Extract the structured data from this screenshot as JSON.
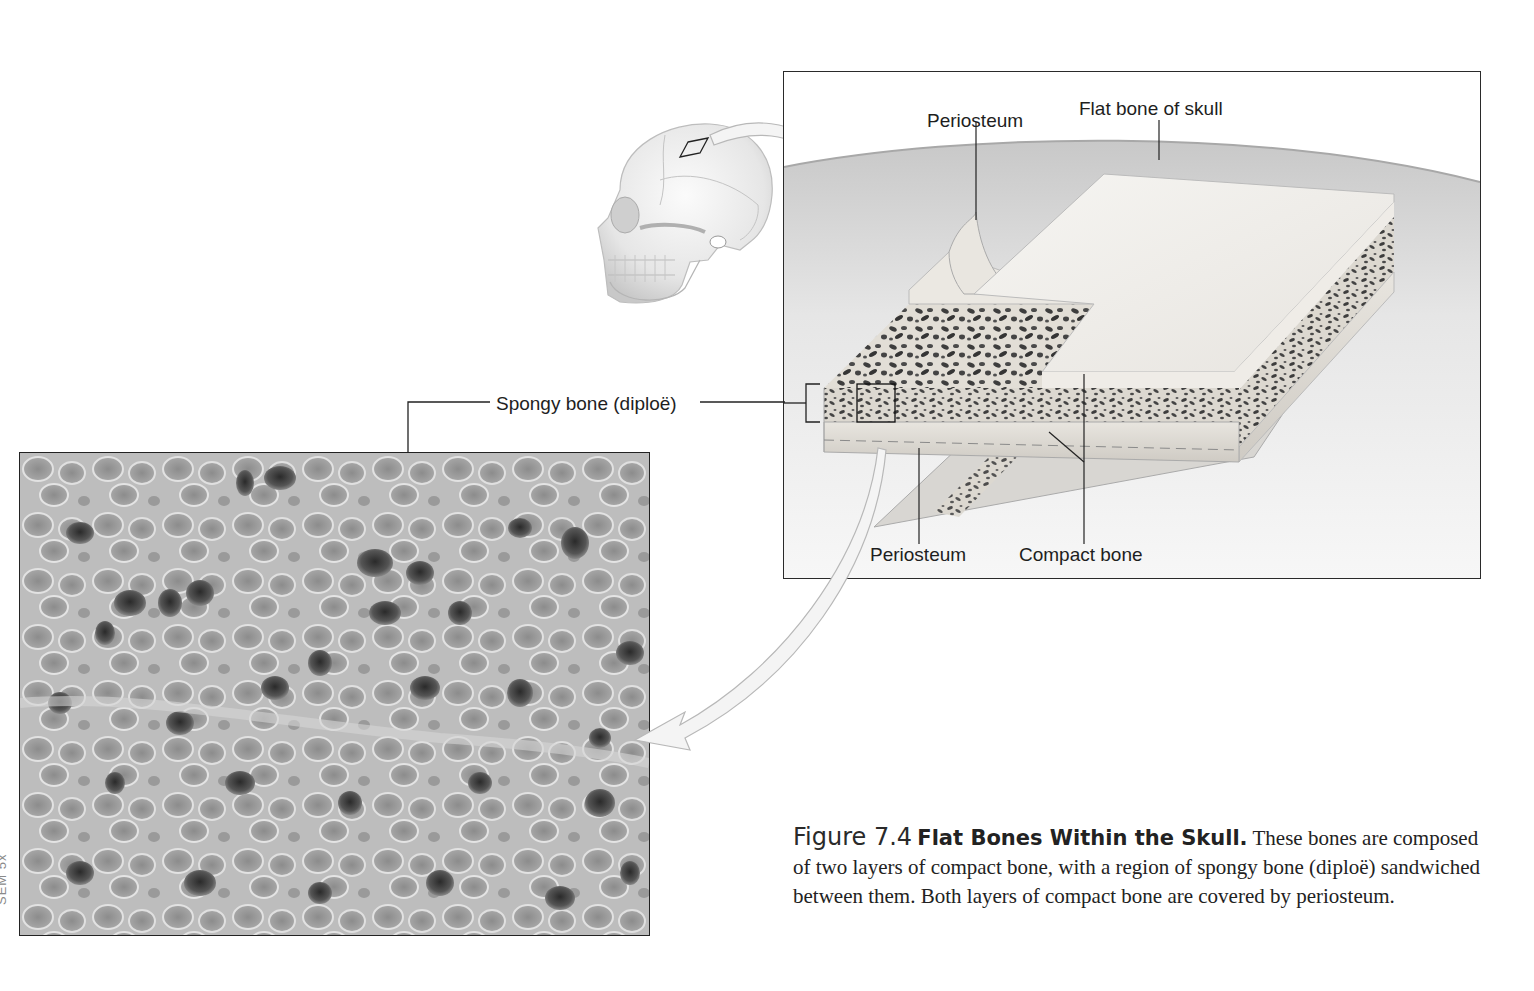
{
  "figure": {
    "number": "Figure 7.4",
    "title": "Flat Bones Within the Skull.",
    "caption_text": "These bones are composed of two layers of compact bone, with a region of spongy bone (diploë) sandwiched between them. Both layers of compact bone are covered by periosteum."
  },
  "labels": {
    "periosteum_top": "Periosteum",
    "flat_bone": "Flat bone of skull",
    "spongy_bone": "Spongy bone (diploë)",
    "periosteum_bottom": "Periosteum",
    "compact_bone": "Compact bone"
  },
  "micrograph": {
    "tag": "SEM 5x"
  },
  "colors": {
    "line": "#2a2a2a",
    "bone_light": "#f2f0ec",
    "bone_shade": "#c9c6c0",
    "pore_dark": "#3a3a3a",
    "arrow_fill": "#f4f4f4",
    "arrow_stroke": "#b8b8b8"
  }
}
